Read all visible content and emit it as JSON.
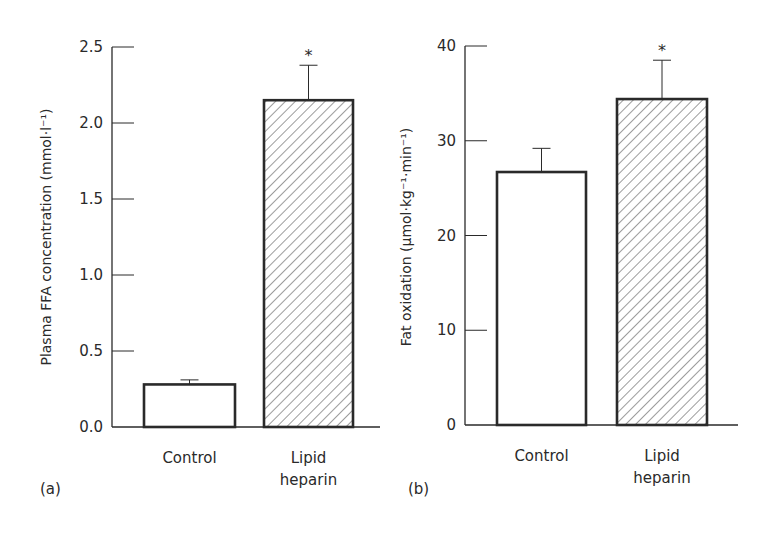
{
  "chart_data": [
    {
      "type": "bar",
      "panel_label": "(a)",
      "categories": [
        "Control",
        "Lipid heparin"
      ],
      "category_lines": [
        [
          "Control"
        ],
        [
          "Lipid",
          "heparin"
        ]
      ],
      "values": [
        0.28,
        2.15
      ],
      "error_upper": [
        0.31,
        2.38
      ],
      "significance": [
        "",
        "*"
      ],
      "fills": [
        "plain",
        "hatched"
      ],
      "title": "",
      "xlabel": "",
      "ylabel": "Plasma FFA concentration (mmol·l⁻¹)",
      "ylim": [
        0,
        2.5
      ],
      "yticks": [
        0.0,
        0.5,
        1.0,
        1.5,
        2.0,
        2.5
      ],
      "ytick_labels": [
        "0.0",
        "0.5",
        "1.0",
        "1.5",
        "2.0",
        "2.5"
      ],
      "grid": false,
      "legend": "none"
    },
    {
      "type": "bar",
      "panel_label": "(b)",
      "categories": [
        "Control",
        "Lipid heparin"
      ],
      "category_lines": [
        [
          "Control"
        ],
        [
          "Lipid",
          "heparin"
        ]
      ],
      "values": [
        26.7,
        34.4
      ],
      "error_upper": [
        29.2,
        38.5
      ],
      "significance": [
        "",
        "*"
      ],
      "fills": [
        "plain",
        "hatched"
      ],
      "title": "",
      "xlabel": "",
      "ylabel": "Fat oxidation (µmol·kg⁻¹·min⁻¹)",
      "ylim": [
        0,
        40
      ],
      "yticks": [
        0,
        10,
        20,
        30,
        40
      ],
      "ytick_labels": [
        "0",
        "10",
        "20",
        "30",
        "40"
      ],
      "grid": false,
      "legend": "none"
    }
  ],
  "colors": {
    "ink": "#2a2a2a",
    "bar_fill": "#ffffff",
    "hatch": "#3a3a3a",
    "background": "#ffffff"
  }
}
